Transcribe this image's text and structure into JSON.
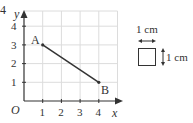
{
  "question_number": "4",
  "graph": {
    "x_axis_label": "x",
    "y_axis_label": "y",
    "origin_label": "O",
    "x_ticks": [
      "1",
      "2",
      "3",
      "4"
    ],
    "y_ticks": [
      "1",
      "2",
      "3",
      "4"
    ],
    "points": [
      {
        "label": "A",
        "x": 1,
        "y": 3
      },
      {
        "label": "B",
        "x": 4,
        "y": 1
      }
    ],
    "segment": "AB"
  },
  "scale_key": {
    "width_label": "1 cm",
    "height_label": "1 cm"
  },
  "colors": {
    "grid": "#d9d9d9",
    "axis": "#333333",
    "segment": "#333333"
  }
}
